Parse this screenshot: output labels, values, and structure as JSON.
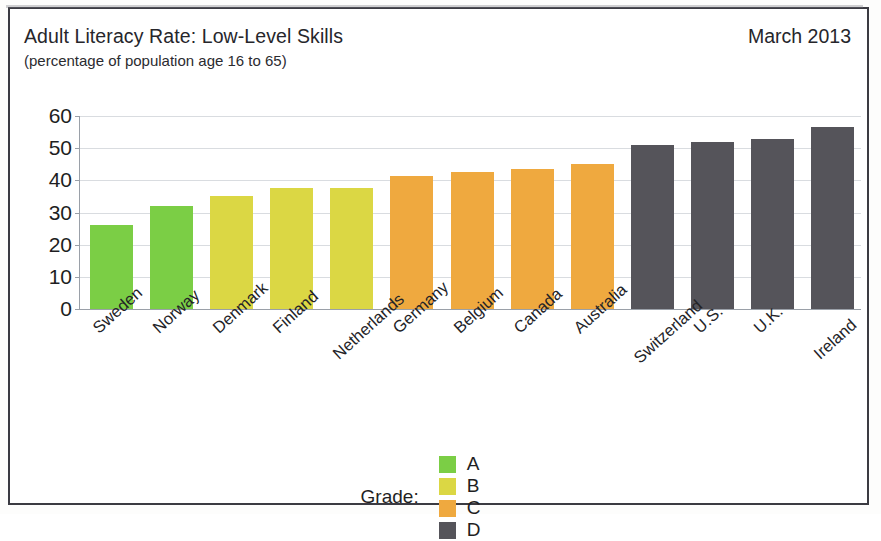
{
  "header": {
    "title": "Adult Literacy Rate: Low-Level Skills",
    "subtitle": "(percentage of population age 16 to 65)",
    "date": "March 2013"
  },
  "legend": {
    "title": "Grade:",
    "items": [
      {
        "label": "A",
        "color": "#7BCE45"
      },
      {
        "label": "B",
        "color": "#DBD744"
      },
      {
        "label": "C",
        "color": "#EFA93F"
      },
      {
        "label": "D",
        "color": "#55545A"
      }
    ]
  },
  "chart_data": {
    "type": "bar",
    "title": "Adult Literacy Rate: Low-Level Skills",
    "subtitle": "(percentage of population age 16 to 65)",
    "xlabel": "",
    "ylabel": "",
    "ylim": [
      0,
      60
    ],
    "yticks": [
      0,
      10,
      20,
      30,
      40,
      50,
      60
    ],
    "ytick_labels": [
      "0",
      "10",
      "20",
      "30",
      "40",
      "50",
      "60"
    ],
    "grid": true,
    "legend_position": "bottom-center",
    "categories": [
      "Sweden",
      "Norway",
      "Denmark",
      "Finland",
      "Netherlands",
      "Germany",
      "Belgium",
      "Canada",
      "Australia",
      "Switzerland",
      "U.S.",
      "U.K.",
      "Ireland"
    ],
    "values": [
      26,
      32,
      35,
      37.5,
      37.5,
      41.5,
      42.5,
      43.5,
      45,
      51,
      52,
      53,
      56.5
    ],
    "grades": [
      "A",
      "A",
      "B",
      "B",
      "B",
      "C",
      "C",
      "C",
      "C",
      "D",
      "D",
      "D",
      "D"
    ],
    "bar_colors": [
      "#7BCE45",
      "#7BCE45",
      "#DBD744",
      "#DBD744",
      "#DBD744",
      "#EFA93F",
      "#EFA93F",
      "#EFA93F",
      "#EFA93F",
      "#55545A",
      "#55545A",
      "#55545A",
      "#55545A"
    ]
  }
}
